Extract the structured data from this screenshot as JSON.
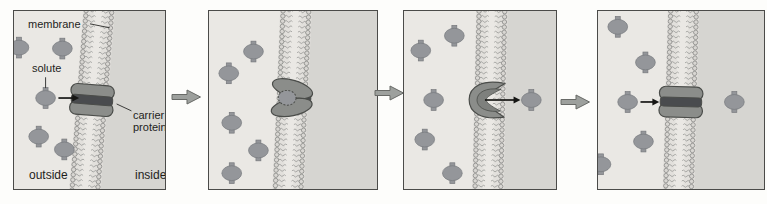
{
  "figure": {
    "labels": {
      "membrane": "membrane",
      "solute": "solute",
      "carrier_protein": "carrier protein",
      "outside": "outside",
      "inside": "inside"
    },
    "colors": {
      "page_bg": "#fdfdfb",
      "outside_bg": "#eae8e4",
      "inside_bg": "#d6d5d1",
      "membrane_gap": "#e2e0dc",
      "membrane_core": "#eae8e4",
      "lipid_head": "#d8d6d2",
      "lipid_head_stroke": "#7f807e",
      "lipid_tail": "#8e8f8d",
      "solute_fill": "#94969a",
      "solute_stroke": "#76787c",
      "carrier_fill": "#8b8d8a",
      "carrier_stroke": "#4a4c49",
      "carrier_band": "#494b4e",
      "carrier_inner": "#7e807d",
      "panel_border": "#4b4b49",
      "block_arrow_fill": "#9da09d",
      "block_arrow_stroke": "#686a67",
      "black_arrow": "#161614",
      "label_color": "#1e1e1c",
      "leader_color": "#3a3a38"
    },
    "panels": [
      {
        "name": "step-1-solute-approaches-carrier",
        "w": 153,
        "h": 180,
        "membrane_cx": 79,
        "tilt": 4.5,
        "carrier_state": "closed",
        "carrier_dy": 0,
        "solutes": [
          [
            5,
            37
          ],
          [
            49,
            38
          ],
          [
            32,
            88
          ],
          [
            25,
            127
          ],
          [
            51,
            140
          ]
        ],
        "black_arrows": [
          [
            45,
            88,
            66,
            88
          ]
        ],
        "leader_lines": [
          [
            77,
            13,
            97,
            17
          ],
          [
            32,
            67,
            32,
            78
          ],
          [
            119,
            101,
            104,
            94
          ]
        ]
      },
      {
        "name": "step-2-solute-binds-open-to-outside",
        "w": 170,
        "h": 180,
        "membrane_cx": 84,
        "tilt": 2.5,
        "carrier_state": "open-outside",
        "carrier_dy": -2,
        "solutes": [
          [
            45,
            41
          ],
          [
            20,
            63
          ],
          [
            23,
            113
          ],
          [
            50,
            141
          ],
          [
            23,
            164
          ]
        ],
        "black_arrows": [],
        "leader_lines": []
      },
      {
        "name": "step-3-carrier-opens-to-inside-releases-solute",
        "w": 154,
        "h": 180,
        "membrane_cx": 87,
        "tilt": 1.3,
        "carrier_state": "open-inside",
        "carrier_dy": 0,
        "solutes": [
          [
            51,
            25
          ],
          [
            17,
            40
          ],
          [
            30,
            90
          ],
          [
            129,
            90
          ],
          [
            21,
            130
          ],
          [
            49,
            164
          ]
        ],
        "black_arrows": [
          [
            82,
            90,
            118,
            90
          ]
        ],
        "leader_lines": []
      },
      {
        "name": "step-4-carrier-resets-next-solute",
        "w": 168,
        "h": 180,
        "membrane_cx": 84,
        "tilt": 1.6,
        "carrier_state": "closed",
        "carrier_dy": 2,
        "solutes": [
          [
            20,
            16
          ],
          [
            48,
            52
          ],
          [
            30,
            92
          ],
          [
            138,
            92
          ],
          [
            46,
            132
          ],
          [
            3,
            155
          ]
        ],
        "black_arrows": [
          [
            43,
            92,
            62,
            92
          ]
        ],
        "leader_lines": []
      }
    ],
    "step_arrow_count": 3
  }
}
